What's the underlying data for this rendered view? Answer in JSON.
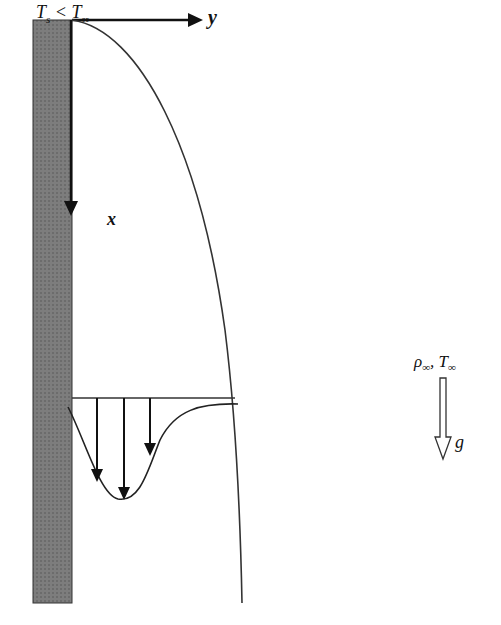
{
  "diagram": {
    "labels": {
      "surface_condition": {
        "T": "T",
        "s_sub": "s",
        "lt": " < ",
        "T2": "T",
        "inf_sub": "∞"
      },
      "y_axis": "y",
      "x_axis": "x",
      "ambient": {
        "rho": "ρ",
        "rho_sub": "∞",
        "sep": ", ",
        "T": "T",
        "T_sub": "∞"
      },
      "gravity": "g"
    },
    "elements": [
      {
        "name": "vertical-plate",
        "fill": "#7a7a7a"
      },
      {
        "name": "boundary-layer-edge",
        "stroke": "#333333"
      },
      {
        "name": "velocity-profile",
        "stroke": "#222222",
        "arrows": 3
      },
      {
        "name": "gravity-arrow",
        "style": "hollow"
      }
    ],
    "colors": {
      "ink": "#111111",
      "plate": "#7a7a7a",
      "background": "#ffffff"
    }
  }
}
